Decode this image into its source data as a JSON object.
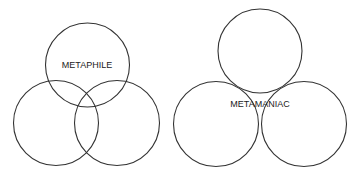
{
  "diagrams": [
    {
      "label": "METAPHILE",
      "circles": [
        {
          "cx": 87.5,
          "cy": 65,
          "r": 42
        },
        {
          "cx": 56,
          "cy": 123,
          "r": 42.5
        },
        {
          "cx": 117,
          "cy": 123,
          "r": 42.5
        }
      ],
      "label_pos": {
        "x": 87,
        "y": 67
      }
    },
    {
      "label": "METAMANIAC",
      "circles": [
        {
          "cx": 260,
          "cy": 51,
          "r": 42
        },
        {
          "cx": 216,
          "cy": 124,
          "r": 42.5
        },
        {
          "cx": 304,
          "cy": 124,
          "r": 42.5
        }
      ],
      "label_pos": {
        "x": 260,
        "y": 106
      }
    }
  ],
  "colors": {
    "stroke": "#333333",
    "text": "#222222",
    "background": "#ffffff"
  }
}
